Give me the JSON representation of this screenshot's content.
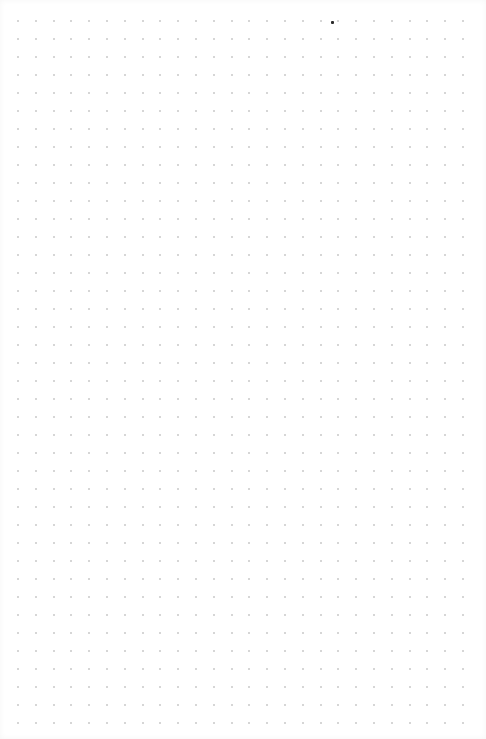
{
  "canvas": {
    "width": 486,
    "height": 739,
    "background": "#ffffff"
  },
  "dot_grid": {
    "columns": 26,
    "rows": 40,
    "origin_x": 17,
    "origin_y": 20,
    "spacing_x": 17.8,
    "spacing_y": 18,
    "dot_color": "#c8c8c8",
    "dot_size": 2
  },
  "marker": {
    "x": 331,
    "y": 21,
    "color": "#2a2a2a",
    "size": 3
  }
}
